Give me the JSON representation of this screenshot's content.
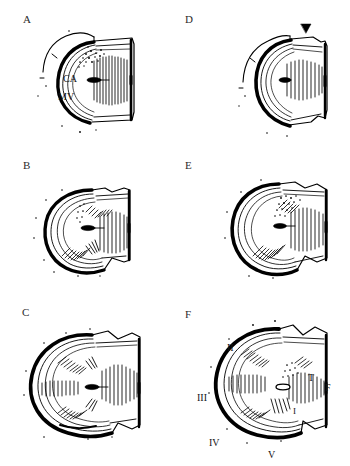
{
  "figure": {
    "type": "scientific-line-drawing-plate",
    "columns": 2,
    "rows": 3,
    "ink_color": "#000000",
    "background_color": "#ffffff",
    "caption_fragment": ""
  },
  "panels": [
    {
      "letter": "A",
      "position": "top-left",
      "annotations": [
        {
          "text": "CA",
          "name": "label-ca"
        },
        {
          "text": "MV",
          "name": "label-mv"
        }
      ],
      "markers": []
    },
    {
      "letter": "D",
      "position": "top-right",
      "annotations": [],
      "markers": [
        {
          "kind": "solid-triangle-arrowhead",
          "name": "arrowhead-marker"
        }
      ]
    },
    {
      "letter": "B",
      "position": "middle-left",
      "annotations": [],
      "markers": []
    },
    {
      "letter": "E",
      "position": "middle-right",
      "annotations": [],
      "markers": []
    },
    {
      "letter": "C",
      "position": "bottom-left",
      "annotations": [],
      "markers": []
    },
    {
      "letter": "F",
      "position": "bottom-right",
      "annotations": [
        {
          "text": "II",
          "name": "label-ii"
        },
        {
          "text": "III",
          "name": "label-iii"
        },
        {
          "text": "IV",
          "name": "label-iv"
        },
        {
          "text": "V",
          "name": "label-v"
        },
        {
          "text": "T",
          "name": "label-t"
        },
        {
          "text": "F",
          "name": "label-f"
        }
      ],
      "markers": []
    }
  ]
}
